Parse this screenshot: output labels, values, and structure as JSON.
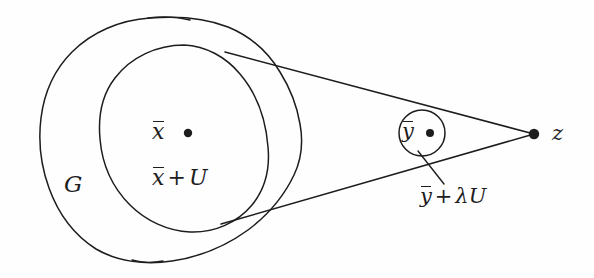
{
  "figure": {
    "type": "mathematical-diagram",
    "background_color": "#fefefe",
    "stroke_color": "#1d1d1d",
    "text_color": "#1d1d1d"
  },
  "labels": {
    "outer_set": "G",
    "center_point_symbol": "x",
    "center_point_overbar": true,
    "neighborhood_left": "x",
    "neighborhood_op": "+",
    "neighborhood_right": "U",
    "small_circle_symbol": "y",
    "small_set_left": "y",
    "small_set_op": "+",
    "small_set_scalar": "λ",
    "small_set_right": "U",
    "apex_point": "z"
  },
  "shapes": {
    "outer_blob_name": "open-set-G",
    "inner_circle_name": "neighborhood-x-plus-U",
    "small_circle_name": "neighborhood-y-plus-lambda-U",
    "upper_tangent_name": "upper-tangent-line",
    "lower_tangent_name": "lower-tangent-line",
    "leader_name": "leader-line-to-small-set-label"
  },
  "points": {
    "x_bar_dot": {
      "cx": 188,
      "cy": 133,
      "r": 4.2
    },
    "y_bar_dot": {
      "cx": 430,
      "cy": 133,
      "r": 4.0
    },
    "z_dot": {
      "cx": 534,
      "cy": 134,
      "r": 5.2
    }
  },
  "geometry": {
    "small_circle": {
      "cx": 422,
      "cy": 133,
      "r": 23
    },
    "inner_circle_bbox": {
      "x": 100,
      "y": 45,
      "w": 168,
      "h": 188
    },
    "outer_blob_bbox": {
      "x": 40,
      "y": 18,
      "w": 262,
      "h": 244
    }
  }
}
